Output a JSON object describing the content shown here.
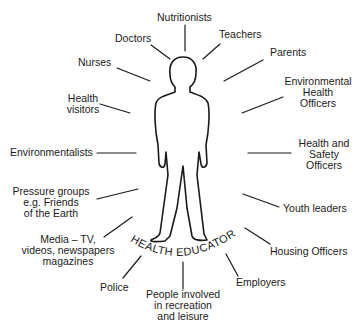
{
  "diagram": {
    "central_label": "HEALTH EDUCATORS",
    "labels": {
      "nutritionists": "Nutritionists",
      "doctors": "Doctors",
      "teachers": "Teachers",
      "parents": "Parents",
      "nurses": "Nurses",
      "env_health_officers": [
        "Environmental",
        "Health",
        "Officers"
      ],
      "health_visitors": [
        "Health",
        "visitors"
      ],
      "environmentalists": "Environmentalists",
      "health_safety_officers": [
        "Health and",
        "Safety",
        "Officers"
      ],
      "pressure_groups": [
        "Pressure groups",
        "e.g. Friends",
        "of the Earth"
      ],
      "youth_leaders": "Youth leaders",
      "media": [
        "Media – TV,",
        "videos, newspapers",
        "magazines"
      ],
      "housing_officers": "Housing Officers",
      "police": "Police",
      "employers": "Employers",
      "people_recreation": [
        "People involved",
        "in recreation",
        "and leisure"
      ]
    }
  }
}
